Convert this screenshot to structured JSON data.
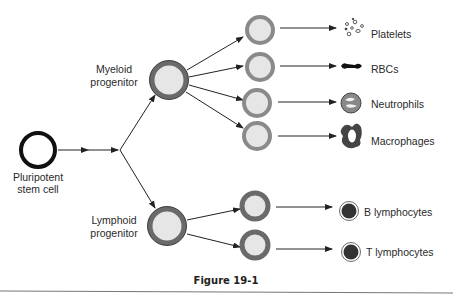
{
  "stem": {
    "label_line1": "Pluripotent",
    "label_line2": "stem cell"
  },
  "myeloid": {
    "label_line1": "Myeloid",
    "label_line2": "progenitor"
  },
  "lymphoid": {
    "label_line1": "Lymphoid",
    "label_line2": "progenitor"
  },
  "outputs": {
    "platelets": "Platelets",
    "rbcs": "RBCs",
    "neutrophils": "Neutrophils",
    "macrophages": "Macrophages",
    "b_lymphocytes": "B lymphocytes",
    "t_lymphocytes": "T lymphocytes"
  },
  "caption": "Figure 19-1",
  "colors": {
    "ring": "#6a6a6a",
    "fill": "#e6e6e6",
    "dark": "#3a3a3a",
    "line": "#222222"
  }
}
